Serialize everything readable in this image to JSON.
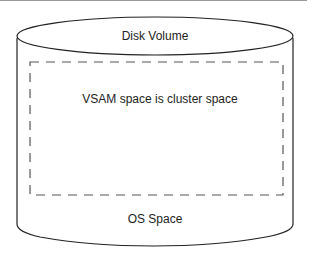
{
  "diagram": {
    "type": "cylinder",
    "labels": {
      "top": "Disk Volume",
      "inner": "VSAM space is cluster space",
      "bottom": "OS Space"
    },
    "colors": {
      "stroke": "#222222",
      "dash": "#555555",
      "background": "#ffffff"
    }
  }
}
